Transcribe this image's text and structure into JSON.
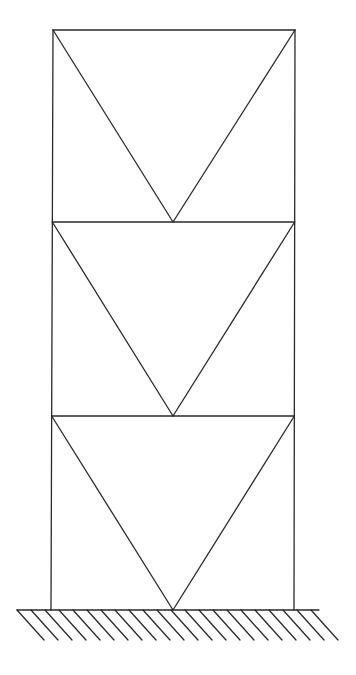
{
  "diagram": {
    "type": "three-story inverted-V (chevron) braced frame on fixed support",
    "stroke_color": "#2a2a2a",
    "background": "#ffffff",
    "columns": {
      "left": {
        "x_top": 53,
        "x_bottom": 51
      },
      "right": {
        "x_top": 295,
        "x_bottom": 294
      }
    },
    "levels_y": [
      30,
      222,
      416,
      610
    ],
    "stories": [
      {
        "name": "story-3",
        "top_y": 30,
        "bottom_y": 222,
        "apex": [
          173,
          222
        ]
      },
      {
        "name": "story-2",
        "top_y": 222,
        "bottom_y": 416,
        "apex": [
          173,
          416
        ]
      },
      {
        "name": "story-1",
        "top_y": 416,
        "bottom_y": 610,
        "apex": [
          173,
          610
        ]
      }
    ],
    "ground": {
      "x_start": 17,
      "x_end": 319,
      "y": 610,
      "hatch_depth": 30,
      "hatch_slant": 27,
      "hatch_spacing": 14,
      "hatch_count": 22
    }
  }
}
